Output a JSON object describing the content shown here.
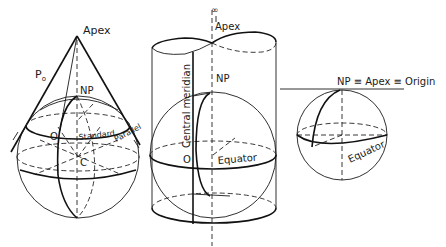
{
  "figures": [
    {
      "id": "conic",
      "title": "Conic projection",
      "labels": {
        "apex": "Apex",
        "p0": "P",
        "p0_sub": "o",
        "np": "NP",
        "origin": "O",
        "standard": "Standard",
        "parallel": "Parallel",
        "center": "C"
      }
    },
    {
      "id": "cylindrical",
      "title": "Cylindrical projection",
      "labels": {
        "infinity": "∞",
        "apex": "Apex",
        "np": "NP",
        "central_meridian": "Central meridian",
        "origin": "O",
        "equator": "Equator"
      }
    },
    {
      "id": "azimuthal",
      "title": "Azimuthal projection",
      "labels": {
        "np_apex_origin": "NP ≡ Apex ≡ Origin",
        "equator": "Equator"
      }
    }
  ],
  "colors": {
    "line": "#1a1a1a",
    "background": "#ffffff"
  }
}
